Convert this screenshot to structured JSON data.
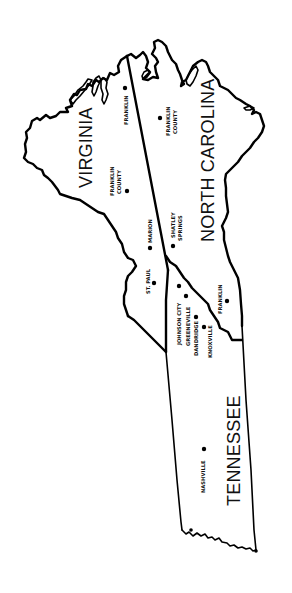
{
  "map": {
    "orientation": "rotated 90 degrees counter-clockwise",
    "colors": {
      "background": "#ffffff",
      "ink": "#000000"
    },
    "states": [
      {
        "name": "VIRGINIA"
      },
      {
        "name": "NORTH CAROLINA"
      },
      {
        "name": "TENNESSEE"
      }
    ],
    "cities": [
      {
        "name": "FRANKLIN",
        "state": "VIRGINIA"
      },
      {
        "name": "FRANKLIN",
        "line2": "COUNTY",
        "state": "NORTH CAROLINA"
      },
      {
        "name": "FRANKLIN",
        "line2": "COUNTY",
        "state": "VIRGINIA"
      },
      {
        "name": "MARION",
        "state": "VIRGINIA"
      },
      {
        "name": "SHATLEY",
        "line2": "SPRINGS",
        "state": "NORTH CAROLINA"
      },
      {
        "name": "ST. PAUL",
        "state": "VIRGINIA"
      },
      {
        "name": "JOHNSON CITY",
        "state": "TENNESSEE"
      },
      {
        "name": "GREENEVILLE",
        "state": "TENNESSEE"
      },
      {
        "name": "DANDRIDGE",
        "state": "TENNESSEE"
      },
      {
        "name": "KNOXVILLE",
        "state": "TENNESSEE"
      },
      {
        "name": "FRANKLIN",
        "state": "NORTH CAROLINA / TENNESSEE"
      },
      {
        "name": "NASHVILLE",
        "state": "TENNESSEE"
      }
    ]
  }
}
